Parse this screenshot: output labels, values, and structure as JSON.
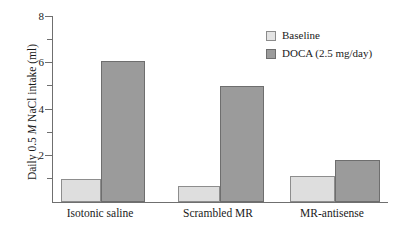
{
  "chart_data": {
    "type": "bar",
    "title": "",
    "xlabel": "",
    "ylabel": "Daily 0.5 M NaCl intake (ml)",
    "ylabel_parts": {
      "pre": "Daily 0.5 ",
      "italic": "M",
      "post": " NaCl intake (ml)"
    },
    "categories": [
      "Isotonic saline",
      "Scrambled MR",
      "MR-antisense"
    ],
    "series": [
      {
        "name": "Baseline",
        "color": "#dedede",
        "values": [
          1.0,
          0.7,
          1.1
        ]
      },
      {
        "name": "DOCA (2.5 mg/day)",
        "color": "#9b9b9b",
        "values": [
          6.05,
          5.0,
          1.8
        ]
      }
    ],
    "ylim": [
      0,
      8
    ],
    "yticks_major": [
      0,
      2,
      4,
      6,
      8
    ],
    "ytick_labels": [
      "",
      "2",
      "4",
      "6",
      "8"
    ],
    "yticks_minor": [
      1,
      3,
      5,
      7
    ],
    "grid": false,
    "legend_position": "top-right"
  },
  "axis": {
    "y_tick_8": "8",
    "y_tick_6": "6",
    "y_tick_4": "4",
    "y_tick_2": "2"
  },
  "legend": {
    "items": [
      {
        "label": "Baseline"
      },
      {
        "label": "DOCA (2.5 mg/day)"
      }
    ]
  }
}
